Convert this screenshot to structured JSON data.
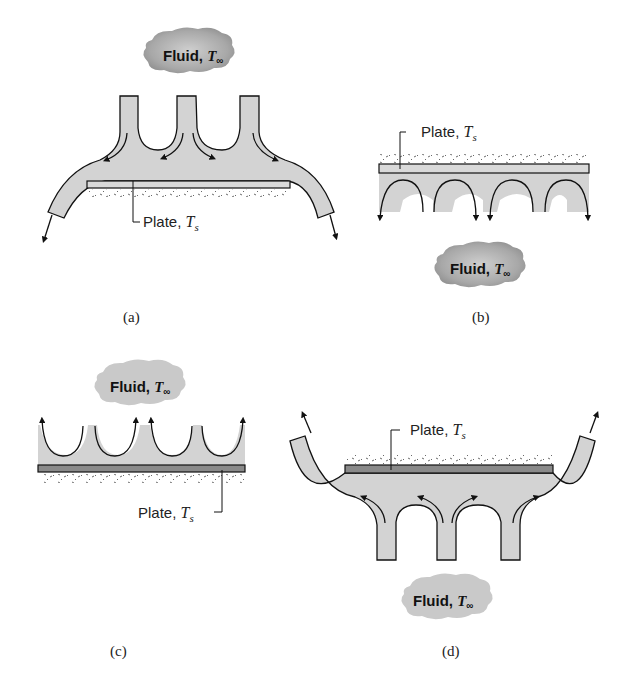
{
  "figure": {
    "panels": [
      {
        "id": "a",
        "caption": "(a)",
        "fluid_label": "Fluid,",
        "fluid_symbol": "T",
        "fluid_subscript": "∞",
        "plate_label": "Plate,",
        "plate_symbol": "T",
        "plate_subscript": "s",
        "description": "Fluid jets impinging downward on top of a heated plate; flow spreads and exits downward at both ends"
      },
      {
        "id": "b",
        "caption": "(b)",
        "fluid_label": "Fluid,",
        "fluid_symbol": "T",
        "fluid_subscript": "∞",
        "plate_label": "Plate,",
        "plate_symbol": "T",
        "plate_subscript": "s",
        "description": "Plate with fluid cells beneath it; flow descends away from the plate toward fluid below"
      },
      {
        "id": "c",
        "caption": "(c)",
        "fluid_label": "Fluid,",
        "fluid_symbol": "T",
        "fluid_subscript": "∞",
        "plate_label": "Plate,",
        "plate_symbol": "T",
        "plate_subscript": "s",
        "description": "Plate with fluid cells above it; flow rises away from the plate toward fluid above"
      },
      {
        "id": "d",
        "caption": "(d)",
        "fluid_label": "Fluid,",
        "fluid_symbol": "T",
        "fluid_subscript": "∞",
        "plate_label": "Plate,",
        "plate_symbol": "T",
        "plate_subscript": "s",
        "description": "Fluid jets rising upward onto the underside of a plate; flow spreads and exits upward at both ends"
      }
    ],
    "colors": {
      "fluid_fill": "#d3d3d3",
      "cloud_fill": "#a9a9a9",
      "plate_light": "#d9d9d9",
      "plate_dark": "#8a8a8a",
      "stroke": "#111111"
    }
  }
}
